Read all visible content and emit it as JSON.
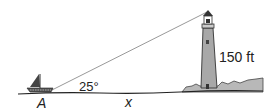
{
  "diagram": {
    "title": "",
    "labels": {
      "angle": "25°",
      "height": "150 ft",
      "point": "A",
      "distance": "x"
    },
    "objects": [
      "sailboat",
      "lighthouse",
      "line-of-sight",
      "shoreline",
      "water"
    ],
    "colors": {
      "line": "#888888",
      "tower": "#a8a8a8",
      "dark": "#333333",
      "shore": "#b8b8b8"
    }
  }
}
